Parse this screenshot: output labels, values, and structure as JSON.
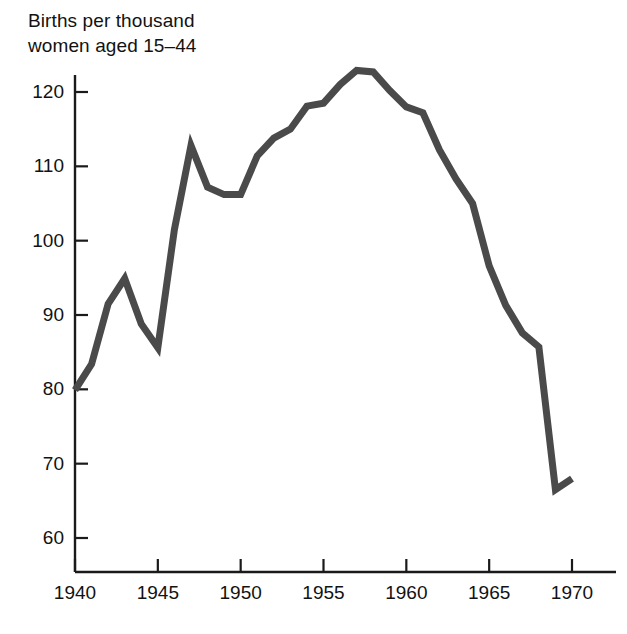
{
  "chart_data": {
    "type": "line",
    "title": "Births per thousand\nwomen aged 15–44",
    "xlabel": "",
    "ylabel": "Births per thousand women aged 15-44",
    "xlim": [
      1940,
      1970
    ],
    "ylim": [
      56,
      126
    ],
    "grid": false,
    "legend": false,
    "line_color": "#4a4a4a",
    "axis_color": "#1a1a1a",
    "x": [
      1940,
      1941,
      1942,
      1943,
      1944,
      1945,
      1946,
      1947,
      1948,
      1949,
      1950,
      1951,
      1952,
      1953,
      1954,
      1955,
      1956,
      1957,
      1958,
      1959,
      1960,
      1961,
      1962,
      1963,
      1964,
      1965,
      1966,
      1967,
      1968,
      1969,
      1970
    ],
    "values": [
      79.9,
      83.4,
      91.5,
      94.9,
      88.8,
      85.6,
      101.5,
      112.8,
      107.2,
      106.2,
      106.2,
      111.4,
      113.8,
      115.0,
      118.1,
      118.5,
      121.0,
      122.9,
      122.7,
      120.2,
      118.0,
      117.2,
      112.2,
      108.3,
      105.0,
      96.6,
      91.3,
      87.6,
      85.7,
      66.5,
      68.0
    ],
    "y_ticks": [
      60,
      70,
      80,
      90,
      100,
      110,
      120
    ],
    "x_ticks": [
      1940,
      1945,
      1950,
      1955,
      1960,
      1965,
      1970
    ],
    "y_tick_labels": [
      "60",
      "70",
      "80",
      "90",
      "100",
      "110",
      "120"
    ],
    "x_tick_labels": [
      "1940",
      "1945",
      "1950",
      "1955",
      "1960",
      "1965",
      "1970"
    ]
  }
}
